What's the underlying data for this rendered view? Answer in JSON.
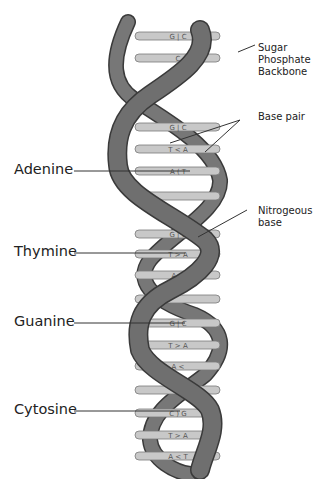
{
  "diagram": {
    "colors": {
      "backbone": "#6f6f6f",
      "backbone_edge": "#3a3a3a",
      "base_pair": "#c8c8c8",
      "base_pair_edge": "#7a7a7a",
      "leader": "#333333",
      "text": "#222222"
    },
    "left_labels": [
      {
        "id": "adenine",
        "text": "Adenine"
      },
      {
        "id": "thymine",
        "text": "Thymine"
      },
      {
        "id": "guanine",
        "text": "Guanine"
      },
      {
        "id": "cytosine",
        "text": "Cytosine"
      }
    ],
    "right_labels": {
      "backbone": [
        "Sugar",
        "Phosphate",
        "Backbone"
      ],
      "base_pair": "Base pair",
      "nitrogenous": [
        "Nitrogeous",
        "base"
      ]
    },
    "base_pairs": [
      {
        "y": 36,
        "text": "G | C"
      },
      {
        "y": 58,
        "text": "C"
      },
      {
        "y": 127,
        "text": "G | C"
      },
      {
        "y": 149,
        "text": "T < A"
      },
      {
        "y": 171,
        "text": "A ( T"
      },
      {
        "y": 196,
        "text": ""
      },
      {
        "y": 234,
        "text": "G | C"
      },
      {
        "y": 254,
        "text": "T > A"
      },
      {
        "y": 275,
        "text": "A <"
      },
      {
        "y": 299,
        "text": ""
      },
      {
        "y": 323,
        "text": "G | C"
      },
      {
        "y": 345,
        "text": "T > A"
      },
      {
        "y": 366,
        "text": "A <"
      },
      {
        "y": 390,
        "text": ""
      },
      {
        "y": 413,
        "text": "C ) G"
      },
      {
        "y": 435,
        "text": "T > A"
      },
      {
        "y": 456,
        "text": "A < T"
      }
    ]
  }
}
